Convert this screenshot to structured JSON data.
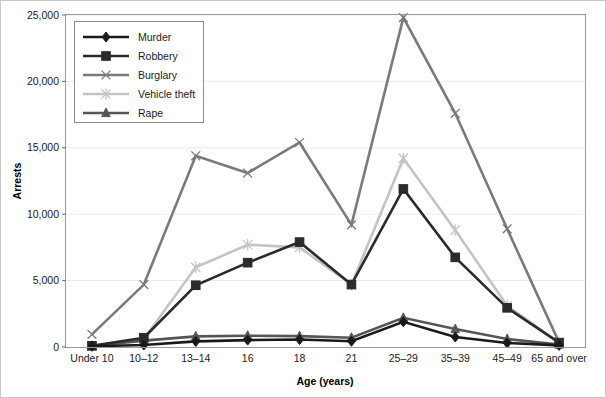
{
  "chart_data": {
    "type": "line",
    "title": "",
    "xlabel": "Age (years)",
    "ylabel": "Arrests",
    "categories": [
      "Under 10",
      "10–12",
      "13–14",
      "16",
      "18",
      "21",
      "25–29",
      "35–39",
      "45–49",
      "65 and over"
    ],
    "ylim": [
      0,
      25000
    ],
    "yticks": [
      0,
      5000,
      10000,
      15000,
      20000,
      25000
    ],
    "ytick_labels": [
      "0",
      "5,000",
      "10,000",
      "15,000",
      "20,000",
      "25,000"
    ],
    "grid": true,
    "legend_position": "top-left",
    "series": [
      {
        "name": "Murder",
        "color": "#1a1a1a",
        "marker": "diamond",
        "values": [
          60,
          150,
          420,
          520,
          560,
          430,
          1900,
          750,
          300,
          120
        ]
      },
      {
        "name": "Robbery",
        "color": "#2b2b2b",
        "marker": "square",
        "values": [
          90,
          700,
          4650,
          6350,
          7900,
          4700,
          11900,
          6750,
          2950,
          330
        ]
      },
      {
        "name": "Burglary",
        "color": "#7a7a7a",
        "marker": "cross",
        "values": [
          950,
          4700,
          14400,
          13100,
          15400,
          9200,
          24800,
          17600,
          8900,
          350
        ]
      },
      {
        "name": "Vehicle theft",
        "color": "#c4c4c4",
        "marker": "star",
        "values": [
          80,
          600,
          6000,
          7700,
          7500,
          4700,
          14200,
          8800,
          3100,
          330
        ]
      },
      {
        "name": "Rape",
        "color": "#565656",
        "marker": "triangle",
        "values": [
          70,
          480,
          800,
          850,
          820,
          700,
          2200,
          1350,
          600,
          180
        ]
      }
    ]
  },
  "legend": {
    "entries": [
      "Murder",
      "Robbery",
      "Burglary",
      "Vehicle theft",
      "Rape"
    ]
  }
}
